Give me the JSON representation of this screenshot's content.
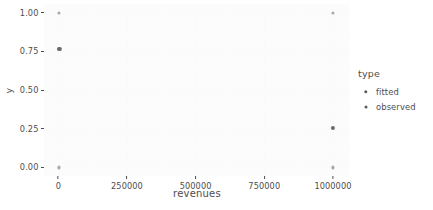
{
  "chart_data": {
    "type": "scatter",
    "title": "",
    "xlabel": "revenues",
    "ylabel": "y",
    "xlim": [
      -52000,
      1062000
    ],
    "ylim": [
      -0.055,
      1.055
    ],
    "grid": false,
    "legend": {
      "title": "type",
      "position": "right",
      "entries": [
        {
          "name": "fitted",
          "color": "#5b5b5b",
          "size": 3.4
        },
        {
          "name": "observed",
          "color": "#5b5b5b",
          "size": 3.0
        }
      ]
    },
    "xticks": [
      {
        "value": 0,
        "label": "0"
      },
      {
        "value": 250000,
        "label": "250000"
      },
      {
        "value": 500000,
        "label": "500000"
      },
      {
        "value": 750000,
        "label": "750000"
      },
      {
        "value": 1000000,
        "label": "1000000"
      }
    ],
    "yticks": [
      {
        "value": 0.0,
        "label": "0.00"
      },
      {
        "value": 0.25,
        "label": "0.25"
      },
      {
        "value": 0.5,
        "label": "0.50"
      },
      {
        "value": 0.75,
        "label": "0.75"
      },
      {
        "value": 1.0,
        "label": "1.00"
      }
    ],
    "series": [
      {
        "name": "observed",
        "color": "#a8a8a8",
        "size": 3.1,
        "points": [
          {
            "x": 4000,
            "y": 1.0
          },
          {
            "x": 4000,
            "y": 0.0
          },
          {
            "x": 1000000,
            "y": 1.0
          },
          {
            "x": 1000000,
            "y": 0.0
          }
        ]
      },
      {
        "name": "fitted",
        "color": "#6b6b6b",
        "size": 4.2,
        "points": [
          {
            "x": 4000,
            "y": 0.765
          },
          {
            "x": 1000000,
            "y": 0.255
          }
        ]
      }
    ]
  }
}
